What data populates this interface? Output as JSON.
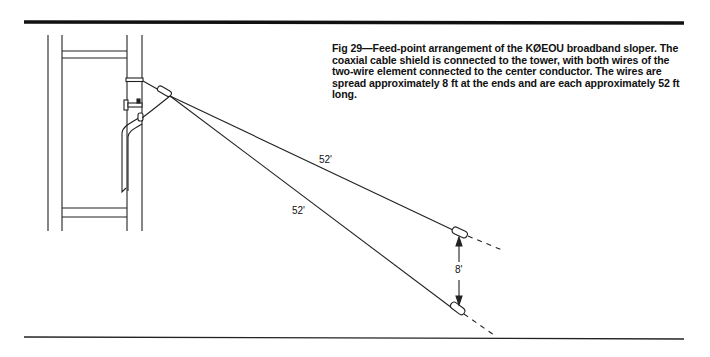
{
  "figure": {
    "caption": "Fig 29—Feed-point arrangement of the KØEOU broadband sloper. The coaxial cable shield is connected to the tower, with both wires of the two-wire element connected to the center conductor. The wires are spread approximately 8 ft at the ends and are each approximately 52 ft long.",
    "labels": {
      "upper_wire_length": "52'",
      "lower_wire_length": "52'",
      "end_spacing": "8'"
    }
  }
}
